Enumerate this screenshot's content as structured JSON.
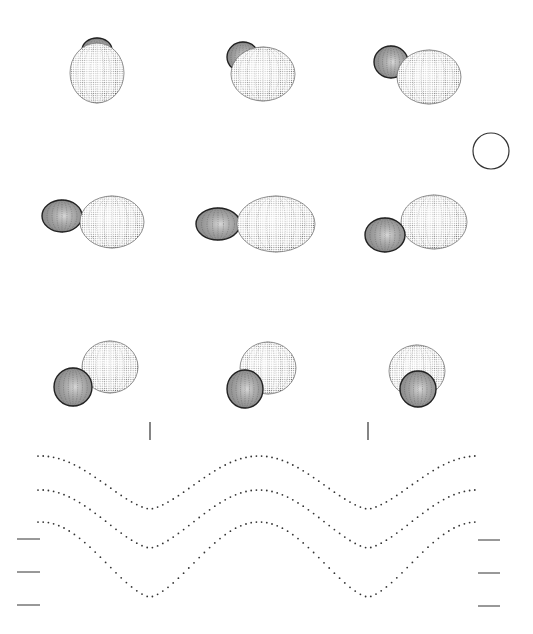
{
  "figure": {
    "background": "#ffffff",
    "ink": "#1a1a1a"
  },
  "binaries": [
    {
      "id": "phase-1",
      "primary": {
        "cx": 97,
        "cy": 73,
        "rx": 27,
        "ry": 30,
        "rot": 0
      },
      "secondary": {
        "cx": 97,
        "cy": 50,
        "rx": 15,
        "ry": 12
      },
      "secondary_front": false
    },
    {
      "id": "phase-2",
      "primary": {
        "cx": 263,
        "cy": 74,
        "rx": 32,
        "ry": 27,
        "rot": 0
      },
      "secondary": {
        "cx": 243,
        "cy": 57,
        "rx": 16,
        "ry": 15
      },
      "secondary_front": false
    },
    {
      "id": "phase-3",
      "primary": {
        "cx": 429,
        "cy": 77,
        "rx": 32,
        "ry": 27,
        "rot": 0
      },
      "secondary": {
        "cx": 391,
        "cy": 62,
        "rx": 17,
        "ry": 16
      },
      "secondary_front": false
    },
    {
      "id": "phase-4",
      "primary": {
        "cx": 112,
        "cy": 222,
        "rx": 32,
        "ry": 26,
        "rot": 0
      },
      "secondary": {
        "cx": 62,
        "cy": 216,
        "rx": 20,
        "ry": 16
      },
      "secondary_front": false
    },
    {
      "id": "phase-5",
      "primary": {
        "cx": 276,
        "cy": 224,
        "rx": 39,
        "ry": 28,
        "rot": 0
      },
      "secondary": {
        "cx": 218,
        "cy": 224,
        "rx": 22,
        "ry": 16
      },
      "secondary_front": false,
      "contact": true
    },
    {
      "id": "phase-6",
      "primary": {
        "cx": 434,
        "cy": 222,
        "rx": 33,
        "ry": 27,
        "rot": 0
      },
      "secondary": {
        "cx": 385,
        "cy": 235,
        "rx": 20,
        "ry": 17
      },
      "secondary_front": true
    },
    {
      "id": "phase-7",
      "primary": {
        "cx": 110,
        "cy": 367,
        "rx": 28,
        "ry": 26,
        "rot": 0
      },
      "secondary": {
        "cx": 73,
        "cy": 387,
        "rx": 19,
        "ry": 19
      },
      "secondary_front": true
    },
    {
      "id": "phase-8",
      "primary": {
        "cx": 268,
        "cy": 368,
        "rx": 28,
        "ry": 26,
        "rot": 0
      },
      "secondary": {
        "cx": 245,
        "cy": 389,
        "rx": 18,
        "ry": 19
      },
      "secondary_front": true
    },
    {
      "id": "phase-9",
      "primary": {
        "cx": 417,
        "cy": 371,
        "rx": 28,
        "ry": 26,
        "rot": 0
      },
      "secondary": {
        "cx": 418,
        "cy": 389,
        "rx": 18,
        "ry": 18
      },
      "secondary_front": true
    }
  ],
  "reference_circle": {
    "cx": 491,
    "cy": 151,
    "r": 18
  },
  "phase_markers": [
    {
      "x": 150,
      "y1": 422,
      "y2": 440
    },
    {
      "x": 368,
      "y1": 422,
      "y2": 440
    }
  ],
  "chart_data": {
    "type": "line",
    "title": "",
    "xlabel": "",
    "ylabel": "",
    "grid": false,
    "x_range_px": [
      38,
      476
    ],
    "minima_x_px": [
      150,
      368
    ],
    "series": [
      {
        "name": "light-curve-top",
        "max_y_px": 456,
        "min_y_px": 509
      },
      {
        "name": "light-curve-middle",
        "max_y_px": 490,
        "min_y_px": 548
      },
      {
        "name": "light-curve-bottom",
        "max_y_px": 522,
        "min_y_px": 597
      }
    ],
    "left_ticks_y_px": [
      539,
      572,
      605
    ],
    "right_ticks_y_px": [
      540,
      573,
      606
    ],
    "left_ticks_x_px": [
      17,
      40
    ],
    "right_ticks_x_px": [
      478,
      500
    ]
  }
}
